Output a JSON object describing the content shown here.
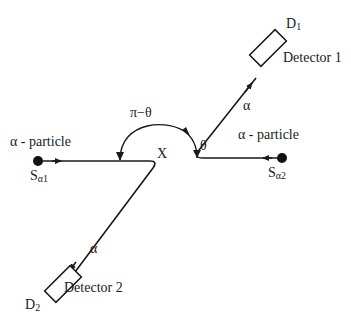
{
  "diagram": {
    "type": "alpha-alpha scattering geometry",
    "colors": {
      "line": "#1a1a1a",
      "background": "#ffffff"
    },
    "center_label": "X",
    "angles": {
      "theta": "θ",
      "pi_minus_theta": "π−θ"
    },
    "sources": [
      {
        "id": "S1",
        "label_main": "S",
        "label_sub": "α1",
        "particle_label": "α - particle"
      },
      {
        "id": "S2",
        "label_main": "S",
        "label_sub": "α2",
        "particle_label": "α - particle"
      }
    ],
    "detectors": [
      {
        "id": "D1",
        "label_main": "D",
        "label_sub": "1",
        "name": "Detector 1",
        "path_label": "α"
      },
      {
        "id": "D2",
        "label_main": "D",
        "label_sub": "2",
        "name": "Detector 2",
        "path_label": "α"
      }
    ]
  }
}
